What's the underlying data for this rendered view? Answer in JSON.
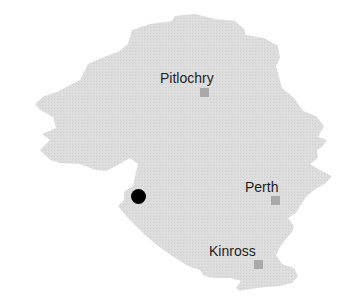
{
  "map": {
    "region_fill": "#dcdcdc",
    "marker_color": "#a9a9a9",
    "dot_color": "#000000",
    "towns": [
      {
        "name": "Pitlochry",
        "label_x": 160,
        "label_y": 70,
        "marker_x": 200,
        "marker_y": 88
      },
      {
        "name": "Perth",
        "label_x": 245,
        "label_y": 179,
        "marker_x": 271,
        "marker_y": 196
      },
      {
        "name": "Kinross",
        "label_x": 209,
        "label_y": 243,
        "marker_x": 254,
        "marker_y": 260
      }
    ],
    "location_dot": {
      "x": 138,
      "y": 196,
      "icon": "location-dot-icon"
    }
  }
}
